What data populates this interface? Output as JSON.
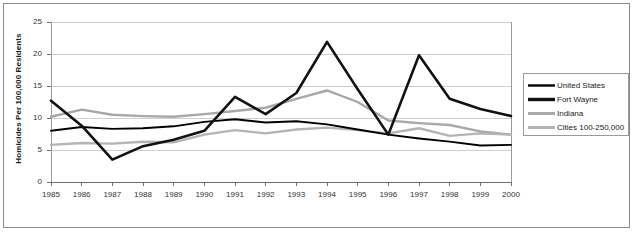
{
  "chart_data": {
    "type": "line",
    "title": "",
    "xlabel": "",
    "ylabel": "Homicides Per 100,000 Residents",
    "x": [
      1985,
      1986,
      1987,
      1988,
      1989,
      1990,
      1991,
      1992,
      1993,
      1994,
      1995,
      1996,
      1997,
      1998,
      1999,
      2000
    ],
    "categories": [
      "1985",
      "1986",
      "1987",
      "1988",
      "1989",
      "1990",
      "1991",
      "1992",
      "1993",
      "1994",
      "1995",
      "1996",
      "1997",
      "1998",
      "1999",
      "2000"
    ],
    "xlim": [
      1985,
      2000
    ],
    "ylim": [
      0,
      25
    ],
    "yticks": [
      0,
      5,
      10,
      15,
      20,
      25
    ],
    "ytick_labels": [
      "0",
      "5",
      "10",
      "15",
      "20",
      "25"
    ],
    "grid": true,
    "grid_axis": "y",
    "legend_position": "right-outside",
    "series": [
      {
        "name": "United States",
        "color": "#000000",
        "width": 1.9,
        "values": [
          8.0,
          8.6,
          8.3,
          8.4,
          8.7,
          9.4,
          9.8,
          9.3,
          9.5,
          9.0,
          8.2,
          7.4,
          6.8,
          6.3,
          5.7,
          5.8
        ]
      },
      {
        "name": "Fort Wayne",
        "color": "#111111",
        "width": 2.6,
        "values": [
          12.7,
          8.8,
          3.5,
          5.6,
          6.6,
          8.0,
          13.3,
          10.6,
          13.9,
          21.9,
          14.5,
          7.4,
          19.8,
          13.0,
          11.4,
          10.3
        ]
      },
      {
        "name": "Indiana",
        "color": "#a8a8a8",
        "width": 2.4,
        "values": [
          10.2,
          11.3,
          10.5,
          10.3,
          10.2,
          10.6,
          11.1,
          11.6,
          13.0,
          14.3,
          12.5,
          9.6,
          9.2,
          8.9,
          7.9,
          7.4
        ]
      },
      {
        "name": "Cities 100-250,000",
        "color": "#b4b4b4",
        "width": 2.4,
        "values": [
          5.8,
          6.1,
          6.0,
          6.3,
          6.2,
          7.4,
          8.1,
          7.6,
          8.2,
          8.5,
          8.1,
          7.6,
          8.4,
          7.2,
          7.6,
          7.4
        ]
      }
    ]
  },
  "legend": {
    "items": [
      {
        "label": "United States"
      },
      {
        "label": "Fort Wayne"
      },
      {
        "label": "Indiana"
      },
      {
        "label": "Cities 100-250,000"
      }
    ]
  }
}
